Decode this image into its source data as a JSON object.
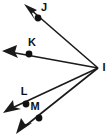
{
  "figure": {
    "type": "geometry-diagram",
    "background_color": "#ffffff",
    "stroke_color": "#1a1a1a",
    "label_color": "#111111",
    "width": 109,
    "height": 138
  },
  "vertex": {
    "label": "I",
    "x": 98,
    "y": 68,
    "label_x": 104,
    "label_y": 68
  },
  "rays": [
    {
      "name": "ray-IJ",
      "through_label": "J",
      "point_x": 38,
      "point_y": 18,
      "label_x": 44,
      "label_y": 8,
      "tip_x": 25,
      "tip_y": 5,
      "start_x": 98,
      "start_y": 68
    },
    {
      "name": "ray-IK",
      "through_label": "K",
      "point_x": 29,
      "point_y": 54,
      "label_x": 32,
      "label_y": 43,
      "tip_x": 3,
      "tip_y": 51,
      "start_x": 98,
      "start_y": 68
    },
    {
      "name": "ray-IL",
      "through_label": "L",
      "point_x": 26,
      "point_y": 104,
      "label_x": 24,
      "label_y": 92,
      "tip_x": 4,
      "tip_y": 113,
      "start_x": 98,
      "start_y": 68
    },
    {
      "name": "ray-IM",
      "through_label": "M",
      "point_x": 39,
      "point_y": 118,
      "label_x": 35,
      "label_y": 107,
      "tip_x": 17,
      "tip_y": 133,
      "start_x": 98,
      "start_y": 68
    }
  ]
}
